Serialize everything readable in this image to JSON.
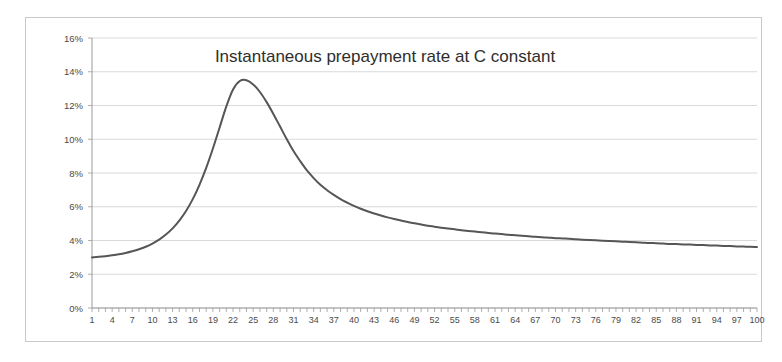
{
  "chart_data": {
    "type": "line",
    "title": "Instantaneous prepayment rate at C constant",
    "xlabel": "",
    "ylabel": "",
    "xlim": [
      1,
      100
    ],
    "ylim": [
      0,
      16
    ],
    "ytick_labels": [
      "16%",
      "14%",
      "12%",
      "10%",
      "8%",
      "6%",
      "4%",
      "2%",
      "0%"
    ],
    "ytick_values": [
      16,
      14,
      12,
      10,
      8,
      6,
      4,
      2,
      0
    ],
    "xtick_labels": [
      "1",
      "4",
      "7",
      "10",
      "13",
      "16",
      "19",
      "22",
      "25",
      "28",
      "31",
      "34",
      "37",
      "40",
      "43",
      "46",
      "49",
      "52",
      "55",
      "58",
      "61",
      "64",
      "67",
      "70",
      "73",
      "76",
      "79",
      "82",
      "85",
      "88",
      "91",
      "94",
      "97",
      "100"
    ],
    "xtick_values": [
      1,
      4,
      7,
      10,
      13,
      16,
      19,
      22,
      25,
      28,
      31,
      34,
      37,
      40,
      43,
      46,
      49,
      52,
      55,
      58,
      61,
      64,
      67,
      70,
      73,
      76,
      79,
      82,
      85,
      88,
      91,
      94,
      97,
      100
    ],
    "grid": true,
    "legend": "none",
    "series_color": "#565656",
    "gridline_color": "#cfcfcf",
    "axis_color": "#9a9a9a",
    "series": [
      {
        "name": "Instantaneous prepayment rate",
        "x": [
          1,
          2,
          3,
          4,
          5,
          6,
          7,
          8,
          9,
          10,
          11,
          12,
          13,
          14,
          15,
          16,
          17,
          18,
          19,
          20,
          21,
          22,
          23,
          24,
          25,
          26,
          27,
          28,
          29,
          30,
          31,
          32,
          33,
          34,
          35,
          36,
          37,
          38,
          39,
          40,
          41,
          42,
          43,
          44,
          45,
          46,
          47,
          48,
          49,
          50,
          51,
          52,
          53,
          54,
          55,
          56,
          57,
          58,
          59,
          60,
          61,
          62,
          63,
          64,
          65,
          66,
          67,
          68,
          69,
          70,
          71,
          72,
          73,
          74,
          75,
          76,
          77,
          78,
          79,
          80,
          81,
          82,
          83,
          84,
          85,
          86,
          87,
          88,
          89,
          90,
          91,
          92,
          93,
          94,
          95,
          96,
          97,
          98,
          99,
          100
        ],
        "values": [
          3.0,
          3.03,
          3.07,
          3.12,
          3.18,
          3.26,
          3.36,
          3.48,
          3.63,
          3.82,
          4.05,
          4.35,
          4.72,
          5.18,
          5.75,
          6.45,
          7.3,
          8.3,
          9.45,
          10.7,
          11.95,
          12.95,
          13.45,
          13.5,
          13.25,
          12.8,
          12.2,
          11.5,
          10.75,
          10.0,
          9.3,
          8.7,
          8.15,
          7.7,
          7.3,
          6.98,
          6.7,
          6.45,
          6.24,
          6.05,
          5.88,
          5.73,
          5.6,
          5.48,
          5.37,
          5.27,
          5.18,
          5.1,
          5.02,
          4.95,
          4.88,
          4.82,
          4.76,
          4.71,
          4.66,
          4.61,
          4.57,
          4.53,
          4.49,
          4.45,
          4.41,
          4.38,
          4.34,
          4.31,
          4.28,
          4.25,
          4.22,
          4.2,
          4.17,
          4.14,
          4.12,
          4.1,
          4.07,
          4.05,
          4.03,
          4.01,
          3.99,
          3.97,
          3.95,
          3.93,
          3.91,
          3.89,
          3.87,
          3.85,
          3.84,
          3.82,
          3.8,
          3.79,
          3.77,
          3.76,
          3.74,
          3.73,
          3.71,
          3.7,
          3.68,
          3.67,
          3.65,
          3.64,
          3.63,
          3.61
        ]
      }
    ]
  }
}
